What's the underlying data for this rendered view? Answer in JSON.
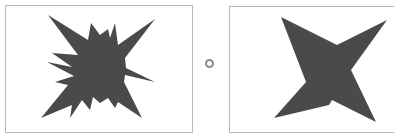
{
  "figure": {
    "colors": {
      "shape_fill": "#4a4a4a",
      "frame_border": "#b8b8b8",
      "separator": "#8a8a8a",
      "background": "#ffffff"
    },
    "left_panel": {
      "label": "jagged star",
      "points": "48,15 88,40 91,23 100,35 108,29 110,38 115,23 118,45 155,19 125,58 126,68 155,82 125,75 124,82 142,118 118,102 115,108 108,98 100,103 93,97 90,110 82,100 70,118 72,105 41,118 68,85 55,82 74,76 47,62 72,67 52,53 78,55"
    },
    "separator": {
      "shape": "circle"
    },
    "right_panel": {
      "label": "simplified star",
      "points": "281,17 337,45 387,20 351,70 376,122 332,100 329,105 274,118 306,82"
    }
  }
}
